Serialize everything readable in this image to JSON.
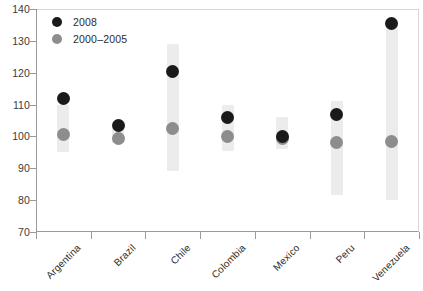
{
  "chart_data": {
    "type": "scatter",
    "title": "",
    "subtitle": "",
    "xlabel": "",
    "ylabel": "",
    "categories": [
      "Argentina",
      "Brazil",
      "Chile",
      "Colombia",
      "Mexico",
      "Peru",
      "Venezuela"
    ],
    "ylim": [
      70,
      140
    ],
    "ytick_labels": [
      "140",
      "130",
      "120",
      "110",
      "100",
      "90",
      "80",
      "70"
    ],
    "ytick_values": [
      140,
      130,
      120,
      110,
      100,
      90,
      80,
      70
    ],
    "grid": false,
    "legend_position": "top-left",
    "series": [
      {
        "name": "2008",
        "marker": "circle",
        "color": "#1a1a1a",
        "values": [
          112.0,
          103.5,
          120.5,
          106.0,
          100.0,
          107.0,
          135.5
        ]
      },
      {
        "name": "2000–2005",
        "marker": "circle",
        "color": "#8d8d8d",
        "values": [
          100.5,
          99.5,
          102.5,
          100.0,
          99.5,
          98.0,
          98.5
        ]
      },
      {
        "name": "range",
        "marker": "bar",
        "color": "#ececec",
        "low": [
          95.0,
          98.0,
          89.0,
          95.5,
          96.0,
          81.5,
          80.0
        ],
        "high": [
          110.0,
          102.5,
          129.0,
          110.0,
          106.0,
          111.0,
          136.5
        ]
      }
    ]
  },
  "legend": {
    "items": [
      {
        "label": "2008",
        "swatch": "recent"
      },
      {
        "label": "2000–2005",
        "swatch": "older"
      }
    ]
  }
}
